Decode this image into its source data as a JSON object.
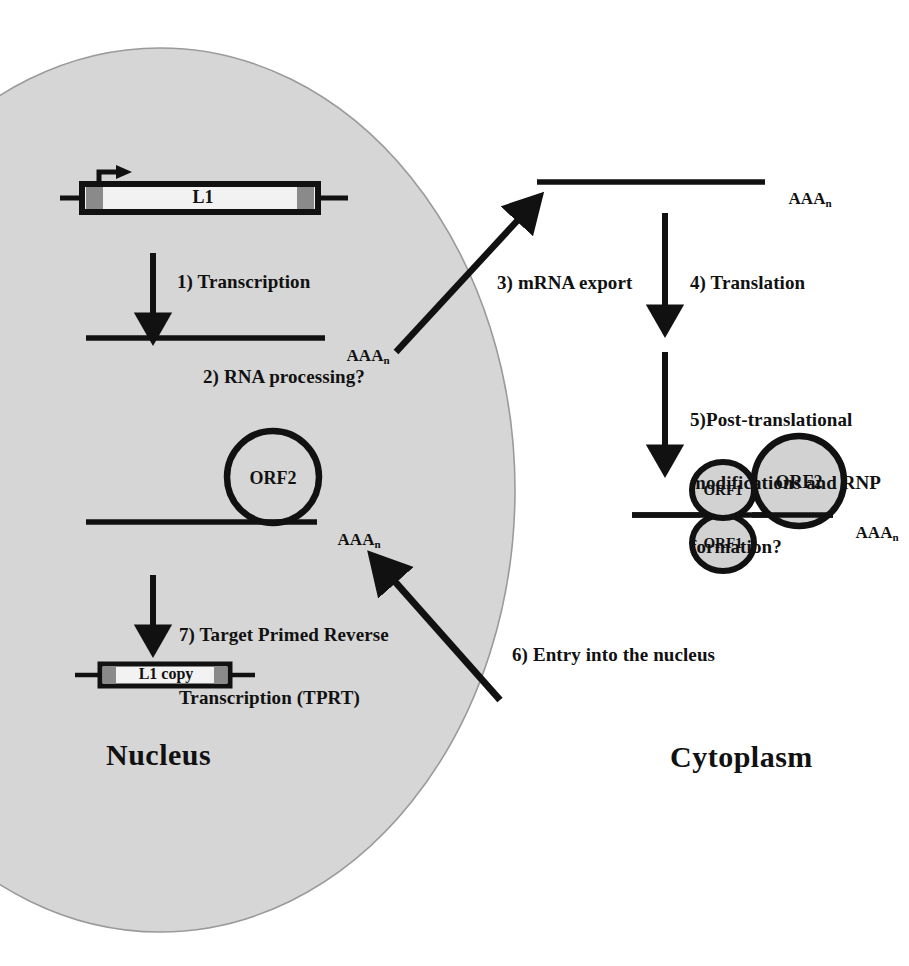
{
  "figure": {
    "title_present": false,
    "compartments": [
      {
        "id": "nucleus",
        "label": "Nucleus",
        "fill": "#d6d6d6"
      },
      {
        "id": "cytoplasm",
        "label": "Cytoplasm",
        "fill": "#ffffff"
      }
    ],
    "colors": {
      "nucleus_fill": "#d6d6d6",
      "nucleus_stroke": "#9a9a9a",
      "stroke": "#111111",
      "element_gray": "#8a8a8a",
      "element_white": "#f2f2f2",
      "circle_gray": "#d2d2d2",
      "circle_white": "#ffffff",
      "background": "#ffffff"
    }
  },
  "steps": [
    {
      "number": "1)",
      "text": "1) Transcription"
    },
    {
      "number": "2)",
      "text": "2) RNA processing?"
    },
    {
      "number": "3)",
      "text": "3) mRNA export"
    },
    {
      "number": "4)",
      "text": "4) Translation"
    },
    {
      "number": "5)",
      "line1": "5)Post-translational",
      "line2": "modifications and RNP",
      "line3": "formation?"
    },
    {
      "number": "6)",
      "text": "6) Entry into the nucleus"
    },
    {
      "number": "7)",
      "line1": "7) Target Primed Reverse",
      "line2": "Transcription (TPRT)"
    }
  ],
  "elements": {
    "l1_genomic": "L1",
    "l1_copy": "L1 copy",
    "orf2_nucleus": "ORF2",
    "orf2_cytoplasm": "ORF2",
    "orf1_top": "ORF1",
    "orf1_bottom": "ORF1"
  },
  "polya": {
    "prefix": "AAA",
    "subscript": "n",
    "instances": [
      "nuclear-transcript",
      "exported-mrna",
      "nuclear-rnp-rna",
      "cytoplasmic-rnp-rna"
    ]
  },
  "labels": {
    "nucleus": "Nucleus",
    "cytoplasm": "Cytoplasm"
  }
}
